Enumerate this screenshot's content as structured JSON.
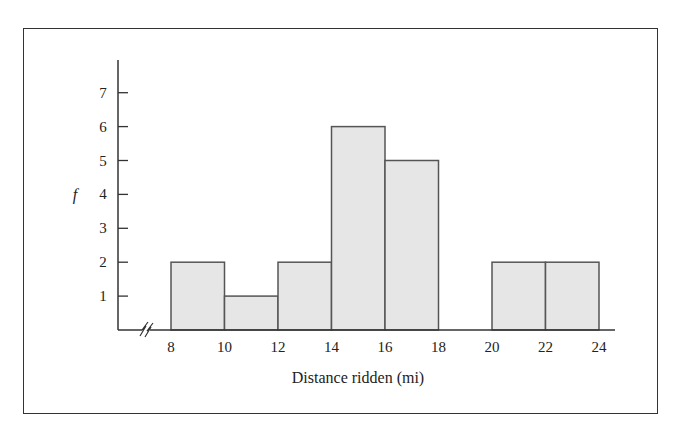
{
  "chart_data": {
    "type": "bar",
    "subtype": "histogram",
    "title": "",
    "xlabel": "Distance ridden (mi)",
    "ylabel": "f",
    "bins": [
      {
        "from": 8,
        "to": 10,
        "value": 2
      },
      {
        "from": 10,
        "to": 12,
        "value": 1
      },
      {
        "from": 12,
        "to": 14,
        "value": 2
      },
      {
        "from": 14,
        "to": 16,
        "value": 6
      },
      {
        "from": 16,
        "to": 18,
        "value": 5
      },
      {
        "from": 18,
        "to": 20,
        "value": 0
      },
      {
        "from": 20,
        "to": 22,
        "value": 2
      },
      {
        "from": 22,
        "to": 24,
        "value": 2
      }
    ],
    "categories": [
      "8-10",
      "10-12",
      "12-14",
      "14-16",
      "16-18",
      "18-20",
      "20-22",
      "22-24"
    ],
    "values": [
      2,
      1,
      2,
      6,
      5,
      0,
      2,
      2
    ],
    "x_ticks": [
      "8",
      "10",
      "12",
      "14",
      "16",
      "18",
      "20",
      "22",
      "24"
    ],
    "y_ticks": [
      "1",
      "2",
      "3",
      "4",
      "5",
      "6",
      "7"
    ],
    "xlim": [
      8,
      24
    ],
    "ylim": [
      0,
      8
    ],
    "x_axis_break": true,
    "grid": false,
    "legend": null,
    "bar_fill": "#e6e6e6",
    "bar_stroke": "#555555"
  }
}
